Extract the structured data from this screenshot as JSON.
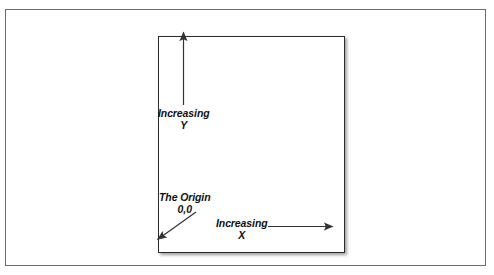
{
  "figure": {
    "type": "diagram",
    "background_color": "#ffffff",
    "outer_frame": {
      "border_color": "#6b6b6b",
      "x": 5,
      "y": 9,
      "width": 481,
      "height": 257
    },
    "plane_box": {
      "border_color": "#2b2b2b",
      "shadow": true,
      "x": 152,
      "y": 26,
      "width": 187,
      "height": 217
    },
    "labels": {
      "y_axis": {
        "line1": "Increasing",
        "line2": "Y"
      },
      "origin": {
        "line1": "The Origin",
        "line2": "0,0"
      },
      "x_axis": {
        "line1": "Increasing",
        "line2": "X"
      }
    },
    "arrows": [
      {
        "name": "y-axis-arrow",
        "direction": "up",
        "color": "#333333"
      },
      {
        "name": "x-axis-arrow",
        "direction": "right",
        "color": "#333333"
      },
      {
        "name": "origin-pointer-arrow",
        "direction": "down-left",
        "color": "#333333"
      }
    ]
  }
}
